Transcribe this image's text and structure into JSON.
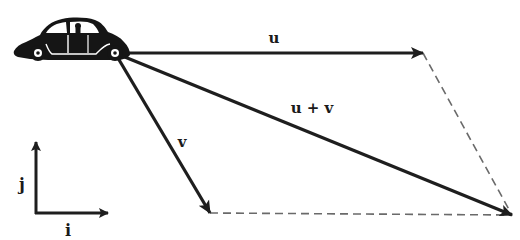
{
  "diagram": {
    "colors": {
      "vector": "#1e1e1e",
      "dashed": "#6a6a6a",
      "car": "#151515",
      "background": "#ffffff"
    },
    "origin": {
      "x": 115,
      "y": 53
    },
    "vectors": [
      {
        "id": "u",
        "label": "u",
        "from": [
          115,
          53
        ],
        "to": [
          423,
          53
        ],
        "label_pos": [
          274,
          43
        ]
      },
      {
        "id": "v",
        "label": "v",
        "from": [
          115,
          53
        ],
        "to": [
          210,
          213
        ],
        "label_pos": [
          182,
          147
        ]
      },
      {
        "id": "u_plus_v",
        "label": "u + v",
        "from": [
          115,
          53
        ],
        "to": [
          512,
          215
        ],
        "label_pos": [
          312,
          113
        ]
      }
    ],
    "dashed_edges": [
      {
        "from": [
          423,
          53
        ],
        "to": [
          512,
          215
        ]
      },
      {
        "from": [
          210,
          213
        ],
        "to": [
          512,
          215
        ]
      }
    ],
    "axes": {
      "corner": [
        36,
        213
      ],
      "i": {
        "label": "i",
        "tip": [
          108,
          213
        ],
        "label_pos": [
          68,
          236
        ]
      },
      "j": {
        "label": "j",
        "tip": [
          36,
          142
        ],
        "label_pos": [
          22,
          190
        ]
      }
    },
    "car": {
      "icon": "car-icon",
      "bbox": [
        14,
        18,
        130,
        63
      ]
    }
  }
}
